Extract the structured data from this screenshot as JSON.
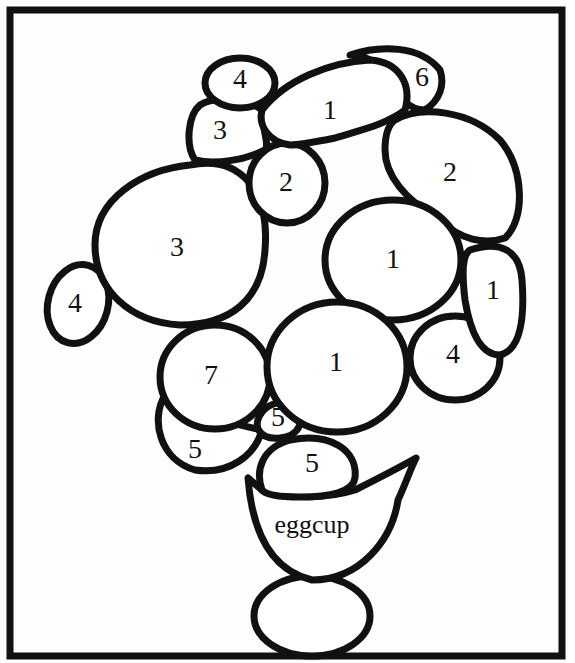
{
  "diagram": {
    "type": "number-coloring puzzle",
    "label": "eggcup",
    "regions": [
      {
        "id": "r1",
        "label": "4",
        "cx": 240,
        "cy": 82
      },
      {
        "id": "r2",
        "label": "6",
        "cx": 422,
        "cy": 80
      },
      {
        "id": "r3",
        "label": "1",
        "cx": 330,
        "cy": 113
      },
      {
        "id": "r4",
        "label": "3",
        "cx": 220,
        "cy": 133
      },
      {
        "id": "r5",
        "label": "2",
        "cx": 286,
        "cy": 185
      },
      {
        "id": "r6",
        "label": "2",
        "cx": 450,
        "cy": 175
      },
      {
        "id": "r7",
        "label": "3",
        "cx": 177,
        "cy": 250
      },
      {
        "id": "r8",
        "label": "1",
        "cx": 393,
        "cy": 262
      },
      {
        "id": "r9",
        "label": "1",
        "cx": 493,
        "cy": 293
      },
      {
        "id": "r10",
        "label": "4",
        "cx": 75,
        "cy": 306
      },
      {
        "id": "r11",
        "label": "7",
        "cx": 211,
        "cy": 378
      },
      {
        "id": "r12",
        "label": "1",
        "cx": 336,
        "cy": 365
      },
      {
        "id": "r13",
        "label": "4",
        "cx": 453,
        "cy": 357
      },
      {
        "id": "r14",
        "label": "5",
        "cx": 278,
        "cy": 420
      },
      {
        "id": "r15",
        "label": "5",
        "cx": 195,
        "cy": 452
      },
      {
        "id": "r16",
        "label": "5",
        "cx": 312,
        "cy": 466
      }
    ],
    "colors": {
      "stroke": "#111111",
      "fill": "#ffffff",
      "background": "#fdfdfd"
    }
  }
}
